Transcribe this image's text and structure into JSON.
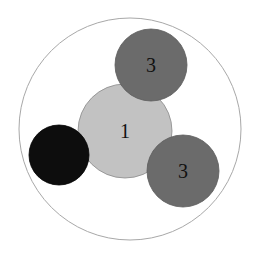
{
  "diagram": {
    "type": "circle-packing",
    "outer": {
      "cx": 130,
      "cy": 129,
      "r": 111,
      "stroke": "#a8a8a8",
      "fill": "#ffffff"
    },
    "circles": [
      {
        "id": "center",
        "label": "1",
        "cx": 125,
        "cy": 131,
        "r": 47,
        "fill": "#c2c2c2",
        "stroke": "#8a8a8a"
      },
      {
        "id": "top",
        "label": "3",
        "cx": 151,
        "cy": 65,
        "r": 36,
        "fill": "#6b6b6b",
        "stroke": "#5a5a5a"
      },
      {
        "id": "bottom-right",
        "label": "3",
        "cx": 183,
        "cy": 171,
        "r": 36,
        "fill": "#6b6b6b",
        "stroke": "#5a5a5a"
      },
      {
        "id": "left",
        "label": "",
        "cx": 59,
        "cy": 155,
        "r": 30,
        "fill": "#0d0d0d",
        "stroke": "#000000"
      }
    ]
  }
}
